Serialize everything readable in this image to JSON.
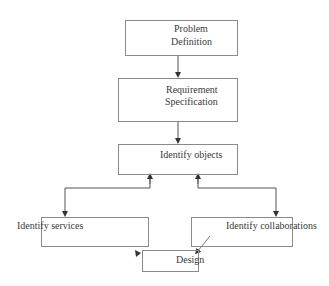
{
  "diagram": {
    "type": "flowchart",
    "nodes": [
      {
        "id": "problem",
        "line1": "Problem",
        "line2": "Definition"
      },
      {
        "id": "requirement",
        "line1": "Requirement",
        "line2": "Specification"
      },
      {
        "id": "objects",
        "label": "Identify objects"
      },
      {
        "id": "services",
        "label": "Identify services"
      },
      {
        "id": "collaborations",
        "label": "Identify collaborations"
      },
      {
        "id": "design",
        "label": "Design"
      }
    ],
    "edges": [
      {
        "from": "problem",
        "to": "requirement",
        "style": "arrow"
      },
      {
        "from": "requirement",
        "to": "objects",
        "style": "arrow"
      },
      {
        "from": "objects",
        "to": "services",
        "style": "bidirectional"
      },
      {
        "from": "objects",
        "to": "collaborations",
        "style": "bidirectional"
      },
      {
        "from": "services",
        "to": "design",
        "style": "arrow"
      },
      {
        "from": "collaborations",
        "to": "design",
        "style": "arrow"
      }
    ],
    "colors": {
      "line": "#555555",
      "box_border": "#8a8a8a",
      "text": "#3a3a3a"
    }
  }
}
